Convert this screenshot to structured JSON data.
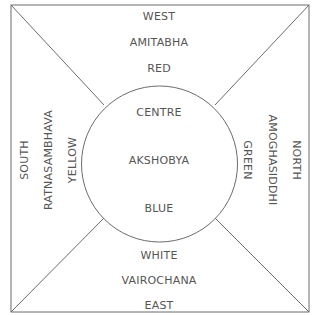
{
  "diagram": {
    "stroke_color": "#6b6b6b",
    "text_color": "#555555",
    "top": {
      "direction": "WEST",
      "buddha": "AMITABHA",
      "color": "RED"
    },
    "left": {
      "direction": "SOUTH",
      "buddha": "RATNASAMBHAVA",
      "color": "YELLOW"
    },
    "right": {
      "direction": "NORTH",
      "buddha": "AMOGHASIDDHI",
      "color": "GREEN"
    },
    "bottom": {
      "direction": "EAST",
      "buddha": "VAIROCHANA",
      "color": "WHITE"
    },
    "centre": {
      "direction": "CENTRE",
      "buddha": "AKSHOBYA",
      "color": "BLUE"
    }
  }
}
